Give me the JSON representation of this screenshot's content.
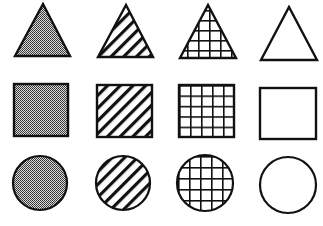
{
  "figure": {
    "description": "Grid of 12 shapes: 3 rows (triangle, square, circle) by 4 columns of fill pattern (dotted/stippled gray, diagonal stripes, cross-hatched grid, empty/white)",
    "rows": [
      "triangle",
      "square",
      "circle"
    ],
    "columns": [
      "stipple",
      "diagonal-stripes",
      "grid",
      "empty"
    ],
    "stroke_color": "#111111",
    "stipple_color": "#7a7a7a",
    "background": "#ffffff"
  },
  "shapes": [
    {
      "shape": "triangle",
      "fill": "stipple"
    },
    {
      "shape": "triangle",
      "fill": "diagonal-stripes"
    },
    {
      "shape": "triangle",
      "fill": "grid"
    },
    {
      "shape": "triangle",
      "fill": "empty"
    },
    {
      "shape": "square",
      "fill": "stipple"
    },
    {
      "shape": "square",
      "fill": "diagonal-stripes"
    },
    {
      "shape": "square",
      "fill": "grid"
    },
    {
      "shape": "square",
      "fill": "empty"
    },
    {
      "shape": "circle",
      "fill": "stipple"
    },
    {
      "shape": "circle",
      "fill": "diagonal-stripes"
    },
    {
      "shape": "circle",
      "fill": "grid"
    },
    {
      "shape": "circle",
      "fill": "empty"
    }
  ]
}
